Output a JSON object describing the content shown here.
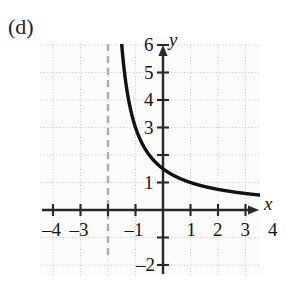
{
  "figure": {
    "part_label": "(d)",
    "axis_x_name": "x",
    "axis_y_name": "y"
  },
  "colors": {
    "curve": "#121010",
    "axis": "#2b2726",
    "grid": "#c9c6c2",
    "asymptote": "#b0aeab",
    "text": "#181414",
    "plot_background": "#fbfbfa"
  },
  "chart_data": {
    "type": "line",
    "title": "",
    "xlabel": "x",
    "ylabel": "y",
    "grid": true,
    "legend_position": "none",
    "xlim": [
      -4.9,
      4.9
    ],
    "ylim": [
      -2.6,
      7.0
    ],
    "xticks": [
      -4,
      -3,
      -2,
      -1,
      1,
      2,
      3,
      4
    ],
    "xtick_labels": [
      "-4",
      "-3",
      "",
      "-1",
      "1",
      "2",
      "3",
      "4"
    ],
    "yticks": [
      1,
      2,
      3,
      4,
      5,
      6,
      -1,
      -2
    ],
    "ytick_labels": [
      "1",
      "",
      "3",
      "4",
      "5",
      "6",
      "",
      "-2"
    ],
    "annotations": [
      {
        "kind": "vertical-asymptote",
        "x": -2,
        "style": "dashed",
        "label": ""
      }
    ],
    "series": [
      {
        "name": "y = 3/(x+2)",
        "style": "solid",
        "x": [
          -1.55,
          -1.6,
          -1.65,
          -1.7,
          -1.75,
          -1.8,
          -1.5,
          -1.4,
          -1.3,
          -1.2,
          -1.1,
          -1.0,
          -0.9,
          -0.8,
          -0.7,
          -0.6,
          -0.5,
          -0.4,
          -0.3,
          -0.2,
          -0.1,
          0,
          0.5,
          1,
          1.5,
          2,
          2.5,
          3,
          3.5,
          4,
          4.5
        ],
        "y": [
          6.67,
          7.5,
          8.57,
          10.0,
          12.0,
          15.0,
          6.0,
          5.0,
          4.29,
          3.75,
          3.33,
          3.0,
          2.73,
          2.5,
          2.31,
          2.14,
          2.0,
          1.88,
          1.76,
          1.67,
          1.58,
          1.5,
          1.2,
          1.0,
          0.86,
          0.75,
          0.67,
          0.6,
          0.55,
          0.5,
          0.46
        ]
      }
    ]
  }
}
